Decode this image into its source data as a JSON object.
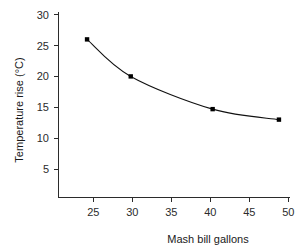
{
  "chart_data": {
    "type": "line",
    "title": "",
    "subtitle": "",
    "xlabel": "Mash bill gallons",
    "ylabel": "Temperature rise (°C)",
    "xlim": [
      21.3,
      51.4
    ],
    "ylim": [
      2.0,
      30.0
    ],
    "xticks": [
      25,
      30,
      35,
      40,
      45,
      50
    ],
    "xticklabels": [
      "25",
      "30",
      "35",
      "40",
      "45",
      "50"
    ],
    "yticks": [
      5,
      10,
      15,
      20,
      25,
      30
    ],
    "yticklabels": [
      "5",
      "10",
      "15",
      "20",
      "25",
      "30"
    ],
    "grid": false,
    "legend": null,
    "marker": "square",
    "marker_color": "#000000",
    "line_color": "#111111",
    "x": [
      24.2,
      29.8,
      40.3,
      48.8
    ],
    "y": [
      26.0,
      20.0,
      14.7,
      13.0
    ],
    "points": [
      {
        "x": 24.2,
        "y": 26.0
      },
      {
        "x": 29.8,
        "y": 20.0
      },
      {
        "x": 40.3,
        "y": 14.7
      },
      {
        "x": 48.8,
        "y": 13.0
      }
    ],
    "annotations": []
  },
  "figure": {
    "background": "#ffffff",
    "axis_color": "#2b2b2b"
  }
}
